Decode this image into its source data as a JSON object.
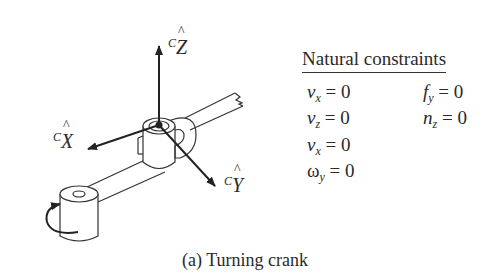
{
  "figure": {
    "caption": "(a) Turning crank",
    "axes": {
      "z": {
        "superscript": "C",
        "letter": "Z",
        "hat": "^"
      },
      "x": {
        "superscript": "C",
        "letter": "X",
        "hat": "^"
      },
      "y": {
        "superscript": "C",
        "letter": "Y",
        "hat": "^"
      }
    }
  },
  "constraints": {
    "title": "Natural constraints",
    "left_column": [
      {
        "symbol": "v",
        "sub": "x",
        "rhs": "= 0"
      },
      {
        "symbol": "v",
        "sub": "z",
        "rhs": "= 0"
      },
      {
        "symbol": "v",
        "sub": "x",
        "rhs": "= 0"
      },
      {
        "symbol": "ω",
        "sub": "y",
        "rhs": "= 0"
      }
    ],
    "right_column": [
      {
        "symbol": "f",
        "sub": "y",
        "rhs": "= 0"
      },
      {
        "symbol": "n",
        "sub": "z",
        "rhs": "= 0"
      }
    ]
  },
  "colors": {
    "ink": "#2a2a2a",
    "background": "#ffffff"
  }
}
